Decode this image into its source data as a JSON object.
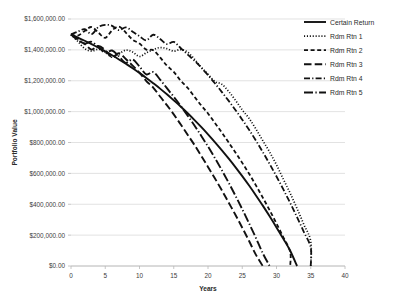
{
  "chart_data": {
    "type": "line",
    "title": "",
    "xlabel": "Years",
    "ylabel": "Portfolio Value",
    "xlim": [
      0,
      40
    ],
    "ylim": [
      0,
      1600000
    ],
    "grid": true,
    "legend_position": "right",
    "x_ticks": [
      "0",
      "5",
      "10",
      "15",
      "20",
      "25",
      "30",
      "35",
      "40"
    ],
    "x_tick_values": [
      0,
      5,
      10,
      15,
      20,
      25,
      30,
      35,
      40
    ],
    "y_ticks": [
      "$0.00",
      "$200,000.00",
      "$400,000.00",
      "$600,000.00",
      "$800,000.00",
      "$1,000,000.00",
      "$1,200,000.00",
      "$1,400,000.00",
      "$1,600,000.00"
    ],
    "y_tick_values": [
      0,
      200000,
      400000,
      600000,
      800000,
      1000000,
      1200000,
      1400000,
      1600000
    ],
    "x": [
      0,
      1,
      2,
      3,
      4,
      5,
      6,
      7,
      8,
      9,
      10,
      11,
      12,
      13,
      14,
      15,
      16,
      17,
      18,
      19,
      20,
      21,
      22,
      23,
      24,
      25,
      26,
      27,
      28,
      29,
      30,
      31,
      32,
      33,
      34,
      35,
      36,
      37,
      38,
      39,
      40
    ],
    "series": [
      {
        "name": "Certain Return",
        "dash": "solid",
        "color": "#111111",
        "width": 1.9,
        "values": [
          1500000,
          1480000,
          1459000,
          1437000,
          1414000,
          1390000,
          1365000,
          1338000,
          1310000,
          1281000,
          1250000,
          1218000,
          1184000,
          1149000,
          1112000,
          1073000,
          1033000,
          991000,
          947000,
          901000,
          853000,
          803000,
          751000,
          697000,
          641000,
          582000,
          521000,
          457000,
          391000,
          322000,
          250000,
          176000,
          99000,
          null,
          null,
          null,
          null,
          null,
          null,
          null,
          null
        ],
        "end_year": 33
      },
      {
        "name": "Rdm Rtn 1",
        "dash": "dotted",
        "color": "#111111",
        "width": 1.7,
        "values": [
          1500000,
          1455000,
          1408000,
          1392000,
          1404000,
          1386000,
          1352000,
          1374000,
          1398000,
          1386000,
          1357000,
          1381000,
          1402000,
          1415000,
          1408000,
          1392000,
          1402000,
          1386000,
          1341000,
          1288000,
          1242000,
          1195000,
          1178000,
          1132000,
          1074000,
          1011000,
          956000,
          887000,
          812000,
          738000,
          655000,
          562000,
          471000,
          372000,
          268000,
          160000,
          null,
          null,
          null,
          null,
          null
        ],
        "end_year": 35
      },
      {
        "name": "Rdm Rtn 2",
        "dash": "short-dash",
        "color": "#111111",
        "width": 1.8,
        "values": [
          1500000,
          1492000,
          1523000,
          1548000,
          1512000,
          1478000,
          1526000,
          1551000,
          1512000,
          1466000,
          1441000,
          1402000,
          1398000,
          1352000,
          1298000,
          1258000,
          1201000,
          1155000,
          1098000,
          1041000,
          988000,
          927000,
          866000,
          801000,
          736000,
          668000,
          598000,
          522000,
          443000,
          361000,
          275000,
          186000,
          92000,
          null,
          null,
          null,
          null,
          null,
          null,
          null,
          null
        ],
        "end_year": 32
      },
      {
        "name": "Rdm Rtn 3",
        "dash": "long-dash",
        "color": "#111111",
        "width": 1.9,
        "values": [
          1500000,
          1462000,
          1438000,
          1402000,
          1425000,
          1398000,
          1352000,
          1378000,
          1341000,
          1298000,
          1252000,
          1198000,
          1156000,
          1098000,
          1042000,
          982000,
          918000,
          852000,
          786000,
          715000,
          642000,
          568000,
          492000,
          412000,
          332000,
          248000,
          162000,
          72000,
          null,
          null,
          null,
          null,
          null,
          null,
          null,
          null,
          null,
          null,
          null,
          null,
          null
        ],
        "end_year": 28
      },
      {
        "name": "Rdm Rtn 4",
        "dash": "dash-dot",
        "color": "#111111",
        "width": 1.8,
        "values": [
          1500000,
          1518000,
          1534000,
          1502000,
          1548000,
          1562000,
          1556000,
          1528000,
          1546000,
          1518000,
          1488000,
          1462000,
          1498000,
          1471000,
          1438000,
          1452000,
          1412000,
          1371000,
          1331000,
          1286000,
          1236000,
          1184000,
          1128000,
          1071000,
          1011000,
          948000,
          882000,
          812000,
          738000,
          661000,
          580000,
          496000,
          408000,
          316000,
          220000,
          120000,
          null,
          null,
          null,
          null,
          null
        ],
        "end_year": 35
      },
      {
        "name": "Rdm Rtn 5",
        "dash": "long-dash-dot",
        "color": "#111111",
        "width": 1.9,
        "values": [
          1500000,
          1471000,
          1441000,
          1452000,
          1418000,
          1381000,
          1396000,
          1358000,
          1316000,
          1338000,
          1292000,
          1241000,
          1256000,
          1208000,
          1152000,
          1096000,
          1038000,
          976000,
          912000,
          844000,
          774000,
          700000,
          622000,
          541000,
          456000,
          368000,
          276000,
          181000,
          82000,
          null,
          null,
          null,
          null,
          null,
          null,
          null,
          null,
          null,
          null,
          null,
          null
        ],
        "end_year": 29
      }
    ]
  },
  "legend": {
    "entries": [
      {
        "label": "Certain Return"
      },
      {
        "label": "Rdm Rtn 1"
      },
      {
        "label": "Rdm Rtn 2"
      },
      {
        "label": "Rdm Rtn 3"
      },
      {
        "label": "Rdm Rtn 4"
      },
      {
        "label": "Rdm Rtn 5"
      }
    ]
  }
}
